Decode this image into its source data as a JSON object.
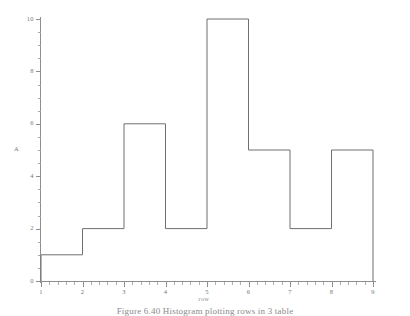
{
  "figure": {
    "caption": "Figure 6.40   Histogram plotting rows in 3 table",
    "background_color": "#ffffff",
    "line_color": "#6f6f6f",
    "axis_color": "#8e8e8e",
    "text_color": "#777777"
  },
  "chart_data": {
    "type": "bar",
    "subtype": "histogram",
    "title": "",
    "xlabel": "row",
    "ylabel": "A",
    "bin_edges": [
      1,
      2,
      3,
      4,
      5,
      6,
      7,
      8,
      9
    ],
    "categories": [
      "1-2",
      "2-3",
      "3-4",
      "4-5",
      "5-6",
      "6-7",
      "7-8",
      "8-9"
    ],
    "values": [
      1,
      2,
      6,
      2,
      10,
      5,
      2,
      5
    ],
    "xlim": [
      1,
      9
    ],
    "ylim": [
      0,
      10
    ],
    "x_ticks": [
      1,
      2,
      3,
      4,
      5,
      6,
      7,
      8,
      9
    ],
    "x_tick_labels": [
      "1",
      "2",
      "3",
      "4",
      "5",
      "6",
      "7",
      "8",
      "9"
    ],
    "x_minor_tick_interval": 0.2,
    "y_ticks": [
      0,
      2,
      4,
      6,
      8,
      10
    ],
    "y_tick_labels": [
      "0",
      "2",
      "4",
      "6",
      "8",
      "10"
    ],
    "y_minor_tick_interval": 0.5,
    "grid": false,
    "legend": false,
    "bar_fill": "none",
    "bar_edge_color": "#6f6f6f"
  }
}
